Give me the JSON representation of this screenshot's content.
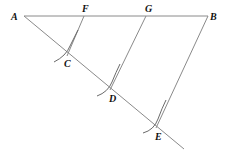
{
  "diagram": {
    "points": {
      "A": "A",
      "B": "B",
      "F": "F",
      "G": "G",
      "C": "C",
      "D": "D",
      "E": "E"
    },
    "segments": [
      "AB",
      "AE",
      "FC",
      "GD",
      "BE"
    ],
    "arcs": [
      "arc-at-C",
      "arc-at-D",
      "arc-at-E"
    ]
  }
}
